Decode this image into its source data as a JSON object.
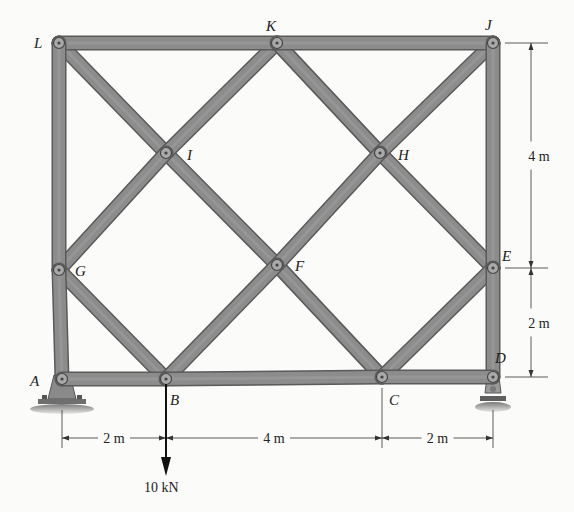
{
  "figure": {
    "type": "truss-diagram",
    "colors": {
      "background": "#fbfbf9",
      "member_fill": "#8c8c8c",
      "member_edge": "#5a5a5a",
      "pin_fill": "#a9a9a9",
      "ink": "#222222"
    },
    "nodes": [
      {
        "id": "L",
        "label": "L",
        "x": 59,
        "y": 43
      },
      {
        "id": "K",
        "label": "K",
        "x": 277,
        "y": 43
      },
      {
        "id": "J",
        "label": "J",
        "x": 493,
        "y": 43
      },
      {
        "id": "I",
        "label": "I",
        "x": 166,
        "y": 153
      },
      {
        "id": "H",
        "label": "H",
        "x": 380,
        "y": 153
      },
      {
        "id": "G",
        "label": "G",
        "x": 59,
        "y": 270
      },
      {
        "id": "F",
        "label": "F",
        "x": 277,
        "y": 265
      },
      {
        "id": "E",
        "label": "E",
        "x": 493,
        "y": 268
      },
      {
        "id": "A",
        "label": "A",
        "x": 62,
        "y": 379
      },
      {
        "id": "B",
        "label": "B",
        "x": 166,
        "y": 379
      },
      {
        "id": "C",
        "label": "C",
        "x": 382,
        "y": 377
      },
      {
        "id": "D",
        "label": "D",
        "x": 493,
        "y": 377
      }
    ],
    "label_positions": {
      "L": [
        34,
        48
      ],
      "K": [
        266,
        31
      ],
      "J": [
        485,
        30
      ],
      "I": [
        187,
        160
      ],
      "H": [
        398,
        160
      ],
      "G": [
        75,
        276
      ],
      "F": [
        295,
        271
      ],
      "E": [
        502,
        261
      ],
      "A": [
        30,
        386
      ],
      "B": [
        170,
        405
      ],
      "C": [
        389,
        405
      ],
      "D": [
        495,
        363
      ]
    },
    "members": [
      [
        "L",
        "K"
      ],
      [
        "K",
        "J"
      ],
      [
        "L",
        "G"
      ],
      [
        "G",
        "A"
      ],
      [
        "J",
        "E"
      ],
      [
        "E",
        "D"
      ],
      [
        "A",
        "B"
      ],
      [
        "B",
        "C"
      ],
      [
        "C",
        "D"
      ],
      [
        "L",
        "I"
      ],
      [
        "I",
        "F"
      ],
      [
        "F",
        "C"
      ],
      [
        "K",
        "I"
      ],
      [
        "I",
        "G"
      ],
      [
        "G",
        "B"
      ],
      [
        "K",
        "H"
      ],
      [
        "H",
        "E"
      ],
      [
        "J",
        "H"
      ],
      [
        "H",
        "F"
      ],
      [
        "F",
        "B"
      ],
      [
        "E",
        "C"
      ]
    ],
    "supports": [
      {
        "node": "A",
        "type": "pin"
      },
      {
        "node": "D",
        "type": "roller"
      }
    ],
    "load": {
      "node": "B",
      "label": "10 kN",
      "direction": "down"
    },
    "dimensions": {
      "horizontal": [
        {
          "from_x": 62,
          "to_x": 166,
          "y": 438,
          "label": "2 m"
        },
        {
          "from_x": 166,
          "to_x": 382,
          "y": 438,
          "label": "4 m"
        },
        {
          "from_x": 382,
          "to_x": 493,
          "y": 438,
          "label": "2 m"
        }
      ],
      "vertical": [
        {
          "x": 531,
          "from_y": 43,
          "to_y": 268,
          "label": "4 m"
        },
        {
          "x": 531,
          "from_y": 268,
          "to_y": 377,
          "label": "2 m"
        }
      ]
    }
  }
}
